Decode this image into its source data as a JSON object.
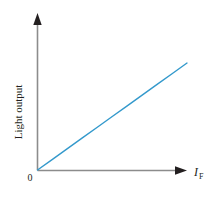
{
  "figure": {
    "background_color": "#ffffff",
    "origin_label": "0"
  },
  "chart_data": {
    "type": "line",
    "title": "",
    "subtitle": "",
    "xlabel": "I_F",
    "xlabel_symbol": "I",
    "xlabel_subscript": "F",
    "ylabel": "Light output",
    "xlim": [
      0,
      1
    ],
    "ylim": [
      0,
      1
    ],
    "grid": false,
    "legend": null,
    "axis_ticks": false,
    "axis_color": "#8c8c8c",
    "arrowhead_color": "#231f20",
    "series": [
      {
        "name": "Light output vs forward current",
        "color": "#3399cc",
        "line_width": 1.4,
        "x": [
          0.0,
          0.1,
          0.2,
          0.3,
          0.4,
          0.5,
          0.6,
          0.7,
          0.8,
          0.9,
          1.0
        ],
        "y": [
          0.0,
          0.069,
          0.138,
          0.207,
          0.276,
          0.345,
          0.414,
          0.483,
          0.552,
          0.621,
          0.69
        ]
      }
    ],
    "annotations": [
      {
        "name": "origin-marker",
        "text": "0",
        "x": 0,
        "y": 0
      }
    ]
  }
}
